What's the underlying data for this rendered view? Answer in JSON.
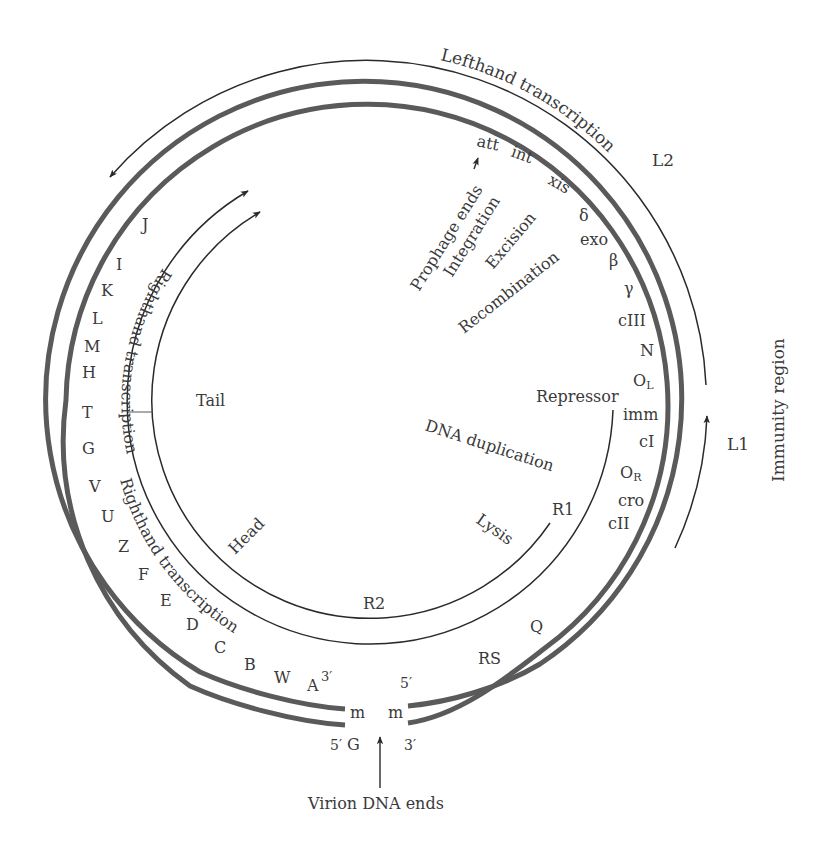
{
  "diagram": {
    "colors": {
      "thick_line": "#5a5a5a",
      "thin_line": "#2a2a2a",
      "text": "#3a3a3a",
      "background": "#ffffff"
    },
    "outer_arcs": {
      "lefthand_transcription": "Lefthand transcription",
      "L2": "L2",
      "L1": "L1",
      "immunity_region": "Immunity region"
    },
    "genes_left": [
      "J",
      "I",
      "K",
      "L",
      "M",
      "H",
      "T",
      "G",
      "V",
      "U",
      "Z",
      "F",
      "E",
      "D",
      "C",
      "B",
      "W",
      "A"
    ],
    "genes_right": [
      "att",
      "int",
      "xis",
      "δ",
      "exo",
      "β",
      "γ",
      "cIII",
      "N",
      "O",
      "imm",
      "cI",
      "O",
      "cro",
      "cII",
      "Q",
      "RS"
    ],
    "subscripts": {
      "OL": "L",
      "OR": "R"
    },
    "functions": {
      "prophage_ends": "Prophage ends",
      "integration": "Integration",
      "excision": "Excision",
      "recombination": "Recombination",
      "repressor": "Repressor",
      "dna_duplication": "DNA duplication",
      "lysis": "Lysis",
      "tail": "Tail",
      "head": "Head"
    },
    "inner_arcs": {
      "righthand_transcription_1": "Righthand transcription",
      "righthand_transcription_2": "Righthand transcription",
      "R1": "R1",
      "R2": "R2"
    },
    "ends": {
      "left_top": "3′",
      "left_m": "m",
      "left_bottom_5": "5′",
      "left_bottom_G": "G",
      "right_top": "5′",
      "right_m": "m",
      "right_bottom": "3′",
      "virion_dna_ends": "Virion DNA ends"
    }
  }
}
